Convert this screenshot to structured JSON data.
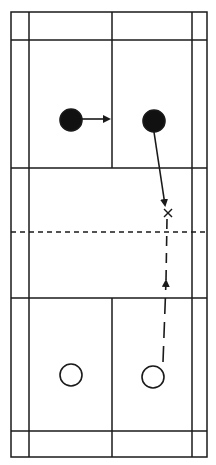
{
  "diagram": {
    "type": "badminton-court-movement-diagram",
    "colors": {
      "lines": "#1a1a1a",
      "background": "#ffffff",
      "player_filled": "#111111",
      "player_open_fill": "#ffffff"
    },
    "court": {
      "outer": {
        "x1": 11,
        "y1": 12,
        "x2": 207,
        "y2": 457
      },
      "sidelines_inner": [
        29,
        192
      ],
      "center_line_x": 112,
      "long_service_lines_y": [
        40,
        431
      ],
      "short_service_lines_y": [
        168,
        298
      ],
      "net_y": 232
    },
    "players": [
      {
        "id": "team-a-left",
        "team": "filled",
        "cx": 71,
        "cy": 120,
        "r": 11
      },
      {
        "id": "team-a-right",
        "team": "filled",
        "cx": 154,
        "cy": 121,
        "r": 11
      },
      {
        "id": "team-b-left",
        "team": "open",
        "cx": 71,
        "cy": 375,
        "r": 11
      },
      {
        "id": "team-b-right",
        "team": "open",
        "cx": 153,
        "cy": 377,
        "r": 11
      }
    ],
    "movements": [
      {
        "id": "a-left-move",
        "from": [
          82,
          119
        ],
        "to": [
          109,
          119
        ],
        "style": "solid"
      },
      {
        "id": "a-right-move",
        "from": [
          154,
          132
        ],
        "to": [
          165,
          205
        ],
        "style": "solid"
      },
      {
        "id": "b-right-move",
        "from": [
          163,
          362
        ],
        "to": [
          166,
          281
        ],
        "style": "dashed"
      }
    ],
    "shuttle_path": {
      "from": [
        167,
        219
      ],
      "to": [
        166,
        281
      ],
      "style": "dashed"
    },
    "target_mark": {
      "symbol": "×",
      "cx": 168,
      "cy": 213
    }
  }
}
